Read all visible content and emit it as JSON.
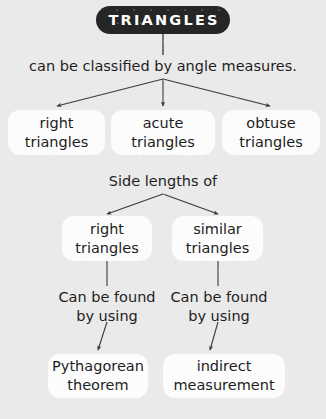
{
  "diagram": {
    "type": "concept-map",
    "background_color": "#ebeaea",
    "title": {
      "text": "TRIANGLES",
      "background_color": "#262626",
      "text_color": "#ffffff"
    },
    "labels": {
      "classified_by": "can be classified by angle measures.",
      "side_lengths_of": "Side lengths of",
      "can_be_found_left_line1": "Can be found",
      "can_be_found_left_line2": "by using",
      "can_be_found_right_line1": "Can be found",
      "can_be_found_right_line2": "by using"
    },
    "angle_nodes": [
      {
        "line1": "right",
        "line2": "triangles"
      },
      {
        "line1": "acute",
        "line2": "triangles"
      },
      {
        "line1": "obtuse",
        "line2": "triangles"
      }
    ],
    "side_nodes": [
      {
        "line1": "right",
        "line2": "triangles"
      },
      {
        "line1": "similar",
        "line2": "triangles"
      }
    ],
    "method_nodes": [
      {
        "line1": "Pythagorean",
        "line2": "theorem"
      },
      {
        "line1": "indirect",
        "line2": "measurement"
      }
    ]
  }
}
